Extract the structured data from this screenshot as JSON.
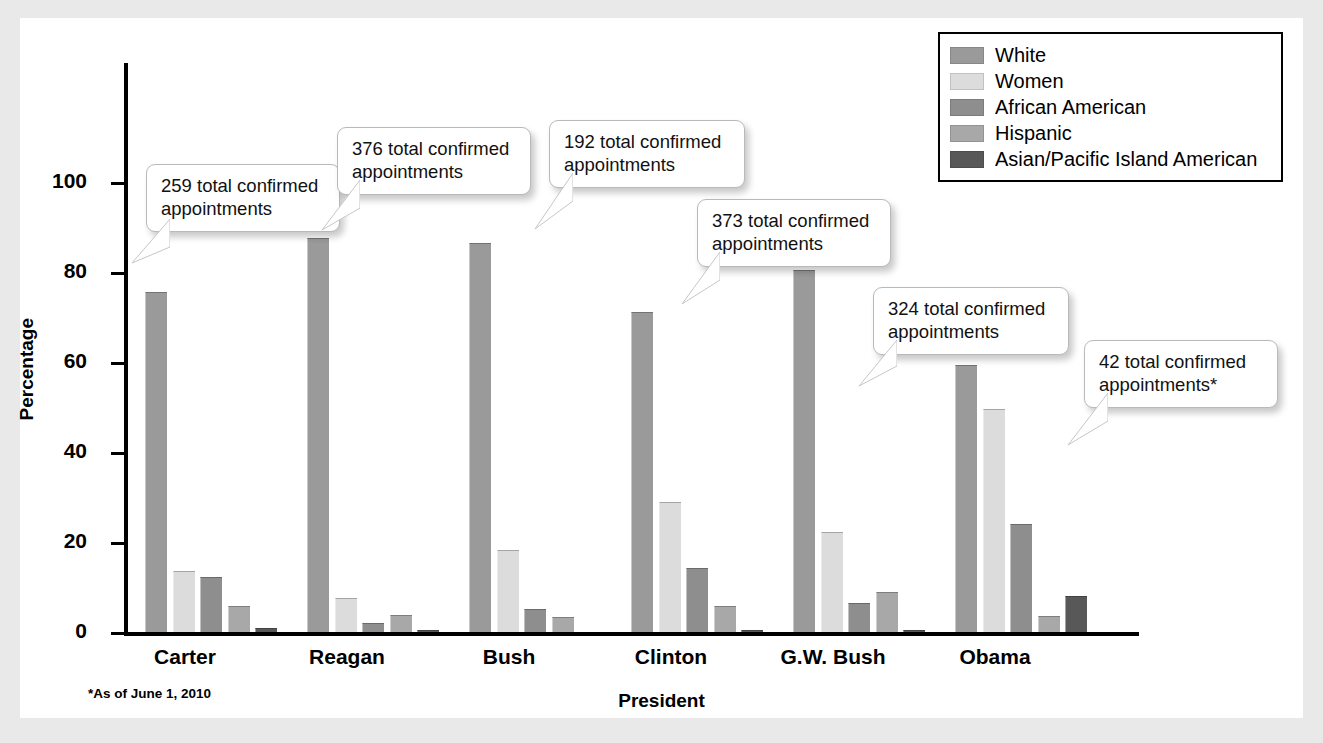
{
  "chart_data": {
    "type": "bar",
    "title": "",
    "xlabel": "President",
    "ylabel": "Percentage",
    "ylim": [
      0,
      110
    ],
    "yticks": [
      0,
      20,
      40,
      60,
      80,
      100
    ],
    "grid": false,
    "legend_position": "top-right",
    "categories": [
      "Carter",
      "Reagan",
      "Bush",
      "Clinton",
      "G.W. Bush",
      "Obama"
    ],
    "series": [
      {
        "name": "White",
        "color": "#9a9a9a",
        "values": [
          75.6,
          87.6,
          86.4,
          71.2,
          80.4,
          59.4
        ]
      },
      {
        "name": "Women",
        "color": "#dcdcdc",
        "values": [
          13.5,
          7.5,
          18.2,
          29.0,
          22.3,
          49.6
        ]
      },
      {
        "name": "African American",
        "color": "#8e8e8e",
        "values": [
          12.3,
          1.9,
          5.2,
          14.2,
          6.5,
          24.1
        ]
      },
      {
        "name": "Hispanic",
        "color": "#a8a8a8",
        "values": [
          5.7,
          3.7,
          3.4,
          5.8,
          8.9,
          3.6
        ]
      },
      {
        "name": "Asian/Pacific Island American",
        "color": "#585858",
        "values": [
          0.9,
          0.5,
          0.0,
          0.5,
          0.5,
          8.0
        ]
      }
    ],
    "annotations": [
      {
        "text": "259 total confirmed\nappointments",
        "value": 259,
        "category": "Carter"
      },
      {
        "text": "376 total confirmed\nappointments",
        "value": 376,
        "category": "Reagan"
      },
      {
        "text": "192 total confirmed\nappointments",
        "value": 192,
        "category": "Bush"
      },
      {
        "text": "373 total confirmed\nappointments",
        "value": 373,
        "category": "Clinton"
      },
      {
        "text": "324 total confirmed\nappointments",
        "value": 324,
        "category": "G.W. Bush"
      },
      {
        "text": "42 total confirmed\nappointments*",
        "value": 42,
        "category": "Obama"
      }
    ],
    "footnote": "*As of June 1, 2010"
  },
  "axis": {
    "y_title": "Percentage",
    "x_title": "President",
    "tick_0": "0",
    "tick_20": "20",
    "tick_40": "40",
    "tick_60": "60",
    "tick_80": "80",
    "tick_100": "100"
  },
  "categories": {
    "c0": "Carter",
    "c1": "Reagan",
    "c2": "Bush",
    "c3": "Clinton",
    "c4": "G.W. Bush",
    "c5": "Obama"
  },
  "legend": {
    "items": [
      {
        "label": "White"
      },
      {
        "label": "Women"
      },
      {
        "label": "African American"
      },
      {
        "label": "Hispanic"
      },
      {
        "label": "Asian/Pacific Island American"
      }
    ]
  },
  "callouts": {
    "a0": "259 total confirmed\nappointments",
    "a1": "376 total confirmed\nappointments",
    "a2": "192 total confirmed\nappointments",
    "a3": "373 total confirmed\nappointments",
    "a4": "324 total confirmed\nappointments",
    "a5": "42 total confirmed\nappointments*"
  },
  "footnote": "*As of June 1, 2010"
}
